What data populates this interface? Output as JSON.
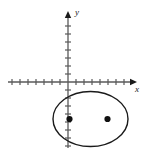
{
  "figure": {
    "kind": "coordinate-plane-ellipse-diagram",
    "background_color": "#ffffff",
    "ink_color": "#1a1a1a",
    "axis_color": "#5a5a5a",
    "width": 146,
    "height": 154
  },
  "axes": {
    "x_axis": {
      "label": "x",
      "label_x": 135,
      "label_y": 92,
      "y_pixel": 82,
      "start_x": 8,
      "end_x": 136,
      "arrow": "right",
      "tick_spacing": 8,
      "ticks_left_of_origin": 7,
      "ticks_right_of_origin": 7,
      "tick_half_length": 3
    },
    "y_axis": {
      "label": "y",
      "label_x": 75,
      "label_y": 15,
      "x_pixel": 68,
      "start_y": 148,
      "end_y": 12,
      "arrow": "up",
      "tick_spacing": 8,
      "ticks_above_origin": 8,
      "ticks_below_origin": 8,
      "tick_half_length": 3
    },
    "origin": {
      "x": 68,
      "y": 82
    }
  },
  "ellipse": {
    "center_x": 90.5,
    "center_y": 119,
    "radius_x": 37.5,
    "radius_y": 27.5,
    "stroke_color": "#1a1a1a",
    "stroke_width": 1.4,
    "fill": "none"
  },
  "foci": [
    {
      "name": "left-focus",
      "x": 69.5,
      "y": 119,
      "r": 3.1
    },
    {
      "name": "right-focus",
      "x": 107.5,
      "y": 119,
      "r": 3.1
    }
  ]
}
